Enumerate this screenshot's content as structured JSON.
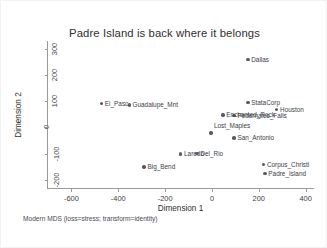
{
  "chart_data": {
    "type": "scatter",
    "title": "Padre Island is back where it belongs",
    "xlabel": "Dimension 1",
    "ylabel": "Dimension 2",
    "xlim": [
      -700,
      440
    ],
    "ylim": [
      -235,
      330
    ],
    "xticks": [
      "-600",
      "-400",
      "-200",
      "0",
      "200",
      "400"
    ],
    "xtick_values": [
      -600,
      -400,
      -200,
      0,
      200,
      400
    ],
    "yticks": [
      "-200",
      "-100",
      "0",
      "100",
      "200",
      "300"
    ],
    "ytick_values": [
      -200,
      -100,
      0,
      100,
      200,
      300
    ],
    "grid": false,
    "legend": "none",
    "marker_color": "#5a5a66",
    "axis_color": "#9a9a9a",
    "text_color": "#3d3d46",
    "footnote": "Modern MDS (loss=stress; transform=identity)",
    "points": [
      {
        "label": "Dallas",
        "x": 155,
        "y": 258,
        "label_pos": "right"
      },
      {
        "label": "StataCorp",
        "x": 155,
        "y": 93,
        "label_pos": "right"
      },
      {
        "label": "Houston",
        "x": 278,
        "y": 68,
        "label_pos": "right"
      },
      {
        "label": "Pedernales_Falls",
        "x": 96,
        "y": 44,
        "label_pos": "right"
      },
      {
        "label": "Enchanted_Rock",
        "x": 48,
        "y": 46,
        "label_pos": "right"
      },
      {
        "label": "El_Paso",
        "x": -470,
        "y": 90,
        "label_pos": "right"
      },
      {
        "label": "Guadalupe_Mnt",
        "x": -352,
        "y": 84,
        "label_pos": "right"
      },
      {
        "label": "Lost_Maples",
        "x": -2,
        "y": -23,
        "label_pos": "above"
      },
      {
        "label": "San_Antonio",
        "x": 96,
        "y": -42,
        "label_pos": "right"
      },
      {
        "label": "Laredo",
        "x": -132,
        "y": -103,
        "label_pos": "right"
      },
      {
        "label": "Del_Rio",
        "x": -62,
        "y": -100,
        "label_pos": "right"
      },
      {
        "label": "Big_Bend",
        "x": -288,
        "y": -152,
        "label_pos": "right"
      },
      {
        "label": "Corpus_Christi",
        "x": 222,
        "y": -143,
        "label_pos": "right"
      },
      {
        "label": "Padre_Island",
        "x": 228,
        "y": -178,
        "label_pos": "right"
      }
    ]
  }
}
